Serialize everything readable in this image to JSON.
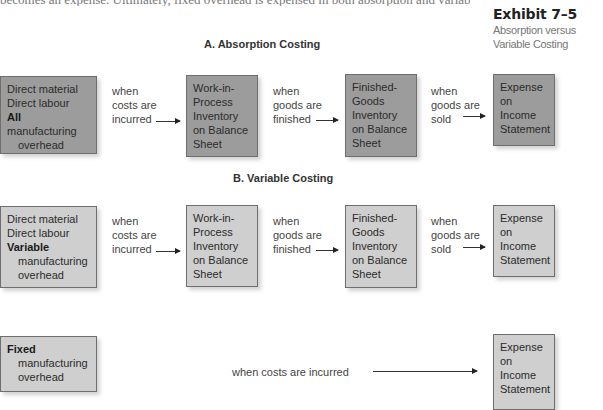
{
  "top_text": "becomes an expense. Ultimately, fixed overhead is expensed in both absorption and variable costing",
  "exhibit": {
    "number": "Exhibit 7–5",
    "caption": "Absorption versus Variable Costing"
  },
  "sections": {
    "absorption": {
      "title": "A. Absorption Costing",
      "source_box": {
        "line1": "Direct material",
        "line2": "Direct labour",
        "bold": "All",
        "line3_rest": " manufacturing",
        "line4": "overhead"
      },
      "arrow1_label": {
        "l1": "when",
        "l2": "costs are",
        "l3": "incurred"
      },
      "wip_box": {
        "l1": "Work-in-",
        "l2": "Process",
        "l3": "Inventory",
        "l4": "on Balance",
        "l5": "Sheet"
      },
      "arrow2_label": {
        "l1": "when",
        "l2": "goods are",
        "l3": "finished"
      },
      "fg_box": {
        "l1": "Finished-",
        "l2": "Goods",
        "l3": "Inventory",
        "l4": "on Balance",
        "l5": "Sheet"
      },
      "arrow3_label": {
        "l1": "when",
        "l2": "goods are",
        "l3": "sold"
      },
      "expense_box": {
        "l1": "Expense",
        "l2": "on",
        "l3": "Income",
        "l4": "Statement"
      },
      "box_color": "#9c9c9c"
    },
    "variable": {
      "title": "B. Variable Costing",
      "source_box": {
        "line1": "Direct material",
        "line2": "Direct labour",
        "bold": "Variable",
        "line3": "manufacturing",
        "line4": "overhead"
      },
      "arrow1_label": {
        "l1": "when",
        "l2": "costs are",
        "l3": "incurred"
      },
      "wip_box": {
        "l1": "Work-in-",
        "l2": "Process",
        "l3": "Inventory",
        "l4": "on Balance",
        "l5": "Sheet"
      },
      "arrow2_label": {
        "l1": "when",
        "l2": "goods are",
        "l3": "finished"
      },
      "fg_box": {
        "l1": "Finished-",
        "l2": "Goods",
        "l3": "Inventory",
        "l4": "on Balance",
        "l5": "Sheet"
      },
      "arrow3_label": {
        "l1": "when",
        "l2": "goods are",
        "l3": "sold"
      },
      "expense_box": {
        "l1": "Expense",
        "l2": "on",
        "l3": "Income",
        "l4": "Statement"
      },
      "fixed_box": {
        "bold": "Fixed",
        "line2": "manufacturing",
        "line3": "overhead"
      },
      "fixed_arrow_label": "when costs are incurred",
      "fixed_expense_box": {
        "l1": "Expense",
        "l2": "on",
        "l3": "Income",
        "l4": "Statement"
      },
      "box_color": "#cfcfcf"
    }
  }
}
